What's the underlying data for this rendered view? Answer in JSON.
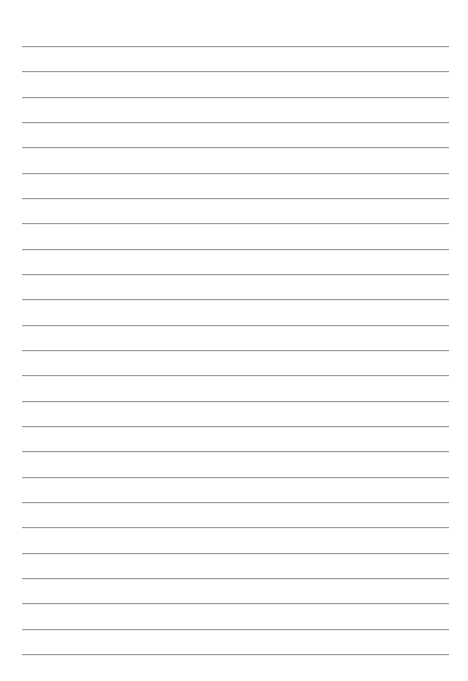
{
  "page": {
    "type": "lined-paper",
    "background_color": "#ffffff",
    "line_color": "#9a9a9a",
    "line_count": 25,
    "first_line_y": 46,
    "line_spacing": 25.33,
    "line_left": 22,
    "line_right": 449
  }
}
